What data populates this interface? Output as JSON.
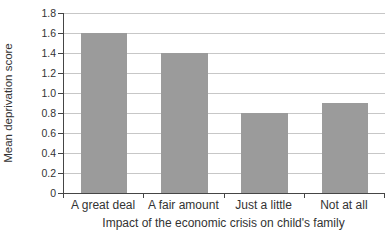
{
  "chart_data": {
    "type": "bar",
    "title": "",
    "categories": [
      "A great deal",
      "A fair amount",
      "Just a little",
      "Not at all"
    ],
    "values": [
      1.6,
      1.4,
      0.8,
      0.9
    ],
    "xlabel": "Impact of the economic crisis on child's family",
    "ylabel": "Mean deprivation score",
    "ylim": [
      0,
      1.8
    ],
    "ytick_step": 0.2,
    "ytick_labels": [
      "0",
      "0.2",
      "0.4",
      "0.6",
      "0.8",
      "1.0",
      "1.2",
      "1.4",
      "1.6",
      "1.8"
    ],
    "grid": "horizontal",
    "legend": "none",
    "bar_color": "#9b9b9b",
    "grid_color": "#c7c7c7",
    "axis_color": "#454545",
    "text_color": "#333333"
  }
}
